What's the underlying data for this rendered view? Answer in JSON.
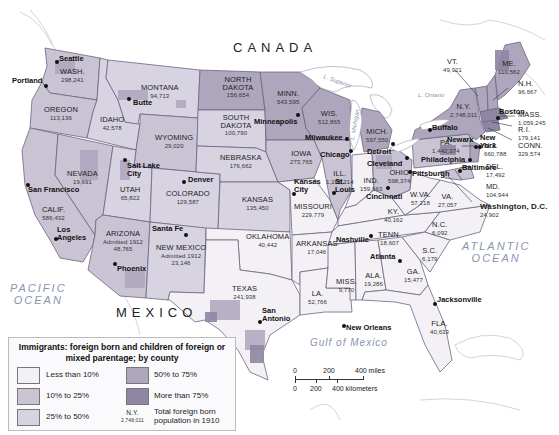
{
  "map": {
    "countries": {
      "north": "CANADA",
      "south": "MEXICO"
    },
    "oceans": {
      "pacific": "PACIFIC\nOCEAN",
      "atlantic": "ATLANTIC\nOCEAN",
      "gulf": "Gulf of Mexico"
    },
    "lakes": {
      "superior": "L. Superior",
      "michigan": "L. Michigan",
      "ontario": "L. Ontario",
      "huron": "L. Huron",
      "erie": "L. Erie"
    },
    "colors": {
      "lt10": "#f3f1f6",
      "10to25": "#c9c3d4",
      "25to50": "#d8d3e0",
      "50to75": "#aea6bd",
      "gt75": "#8f86a3",
      "border": "#6c6680",
      "water": "#ffffff",
      "ocean_text": "#8a94b0"
    },
    "states": [
      {
        "name": "WASH.",
        "pop": "298,241"
      },
      {
        "name": "OREGON",
        "pop": "113,136"
      },
      {
        "name": "CALIF.",
        "pop": "586,432"
      },
      {
        "name": "NEVADA",
        "pop": "19,691"
      },
      {
        "name": "IDAHO",
        "pop": "42,578"
      },
      {
        "name": "MONTANA",
        "pop": "94,713"
      },
      {
        "name": "WYOMING",
        "pop": "29,020"
      },
      {
        "name": "UTAH",
        "pop": "65,822"
      },
      {
        "name": "ARIZONA",
        "note": "Admitted 1912",
        "pop": "48,765"
      },
      {
        "name": "COLORADO",
        "pop": "129,587"
      },
      {
        "name": "NEW MEXICO",
        "note": "Admitted 1912",
        "pop": "23,146"
      },
      {
        "name": "NORTH DAKOTA",
        "pop": "156,654"
      },
      {
        "name": "SOUTH DAKOTA",
        "pop": "100,790"
      },
      {
        "name": "NEBRASKA",
        "pop": "176,662"
      },
      {
        "name": "KANSAS",
        "pop": "135,450"
      },
      {
        "name": "OKLAHOMA",
        "pop": "40,442"
      },
      {
        "name": "TEXAS",
        "pop": "241,938"
      },
      {
        "name": "MINN.",
        "pop": "543,595"
      },
      {
        "name": "IOWA",
        "pop": "273,765"
      },
      {
        "name": "MISSOURI",
        "pop": "229,779"
      },
      {
        "name": "ARKANSAS",
        "pop": "17,046"
      },
      {
        "name": "LA.",
        "pop": "52,766"
      },
      {
        "name": "WIS.",
        "pop": "512,865"
      },
      {
        "name": "ILL.",
        "pop": "1,205,314"
      },
      {
        "name": "MICH.",
        "pop": "597,550"
      },
      {
        "name": "IND.",
        "pop": "159,663"
      },
      {
        "name": "OHIO",
        "pop": "598,374"
      },
      {
        "name": "KY.",
        "pop": "40,162"
      },
      {
        "name": "TENN.",
        "pop": "18,607"
      },
      {
        "name": "MISS.",
        "pop": "9,770"
      },
      {
        "name": "ALA.",
        "pop": "19,286"
      },
      {
        "name": "GA.",
        "pop": "15,477"
      },
      {
        "name": "FLA.",
        "pop": "40,633"
      },
      {
        "name": "S.C.",
        "pop": "6,179"
      },
      {
        "name": "N.C.",
        "pop": "6,092"
      },
      {
        "name": "VA.",
        "pop": "27,057"
      },
      {
        "name": "W.VA.",
        "pop": "57,218"
      },
      {
        "name": "PA.",
        "pop": "1,442,374"
      },
      {
        "name": "N.Y.",
        "pop": "2,748,011"
      },
      {
        "name": "VT.",
        "pop": "49,921"
      },
      {
        "name": "ME.",
        "pop": "110,562"
      },
      {
        "name": "N.H.",
        "pop": "96,667"
      },
      {
        "name": "MASS.",
        "pop": "1,059,245"
      },
      {
        "name": "R.I.",
        "pop": "179,141"
      },
      {
        "name": "CONN.",
        "pop": "329,574"
      },
      {
        "name": "N.J.",
        "pop": "660,788"
      },
      {
        "name": "DEL.",
        "pop": "17,492"
      },
      {
        "name": "MD.",
        "pop": "104,944"
      },
      {
        "name": "Washington, D.C.",
        "pop": "24,902"
      }
    ],
    "cities": [
      "Seattle",
      "Portland",
      "Butte",
      "San Francisco",
      "Los Angeles",
      "Salt Lake City",
      "Denver",
      "Santa Fe",
      "Phoenix",
      "San Antonio",
      "Minneapolis",
      "Milwaukee",
      "Chicago",
      "Kansas City",
      "St. Louis",
      "Detroit",
      "Cleveland",
      "Cincinnati",
      "Nashville",
      "Atlanta",
      "New Orleans",
      "Jacksonville",
      "Buffalo",
      "Pittsburgh",
      "Philadelphia",
      "Baltimore",
      "Newark",
      "New York",
      "Boston"
    ]
  },
  "legend": {
    "title": "Immigrants: foreign born and children of foreign or mixed parentage; by county",
    "items": [
      {
        "label": "Less than 10%"
      },
      {
        "label": "10% to 25%"
      },
      {
        "label": "25% to 50%"
      },
      {
        "label": "50% to 75%"
      },
      {
        "label": "More than 75%"
      }
    ],
    "sample_state": "N.Y.",
    "sample_pop": "2,748,011",
    "sample_desc": "Total foreign born population in 1910"
  },
  "scale": {
    "miles": [
      "0",
      "200",
      "400 miles"
    ],
    "km": [
      "0",
      "200",
      "400 kilometers"
    ]
  }
}
